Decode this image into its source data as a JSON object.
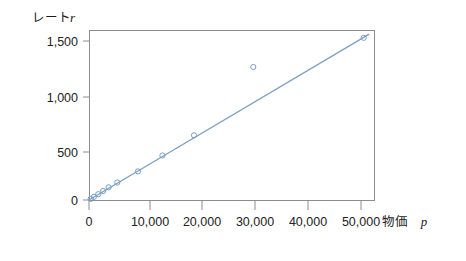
{
  "chart_data": {
    "type": "scatter",
    "title": "",
    "subtitle": "",
    "xlabel": "物価",
    "xlabel_symbol": "p",
    "ylabel": "レート",
    "ylabel_symbol": "r",
    "xlim": [
      -1500,
      55000
    ],
    "ylim": [
      -60,
      1620
    ],
    "xticks": [
      0,
      10000,
      20000,
      30000,
      40000,
      50000
    ],
    "xticklabels": [
      "0",
      "10,000",
      "20,000",
      "30,000",
      "40,000",
      "50,000"
    ],
    "yticks": [
      0,
      500,
      1000,
      1500
    ],
    "yticklabels": [
      "0",
      "500",
      "1,000",
      "1,500"
    ],
    "grid": false,
    "legend": false,
    "legend_position": "none",
    "series": [
      {
        "name": "observations",
        "type": "scatter",
        "marker": "open-circle",
        "color": "#7a9fc4",
        "points": [
          {
            "x": 300,
            "y": 10
          },
          {
            "x": 900,
            "y": 30
          },
          {
            "x": 1700,
            "y": 55
          },
          {
            "x": 2600,
            "y": 85
          },
          {
            "x": 3600,
            "y": 120
          },
          {
            "x": 5200,
            "y": 165
          },
          {
            "x": 9000,
            "y": 270
          },
          {
            "x": 13500,
            "y": 420
          },
          {
            "x": 19300,
            "y": 610
          },
          {
            "x": 30200,
            "y": 1255
          },
          {
            "x": 50500,
            "y": 1530
          }
        ]
      },
      {
        "name": "fitted-line",
        "type": "line",
        "color": "#7a9fc4",
        "x": [
          0,
          51500
        ],
        "y": [
          0,
          1565
        ]
      }
    ],
    "annotations": []
  },
  "axes": {
    "y_axis_label_text": "レート",
    "y_axis_label_symbol": "r",
    "x_axis_label_text": "物価",
    "x_axis_label_symbol": "p"
  },
  "colors": {
    "series": "#7a9fc4",
    "frame": "#8d8d8d",
    "text": "#1a1a1a",
    "background": "#ffffff"
  }
}
